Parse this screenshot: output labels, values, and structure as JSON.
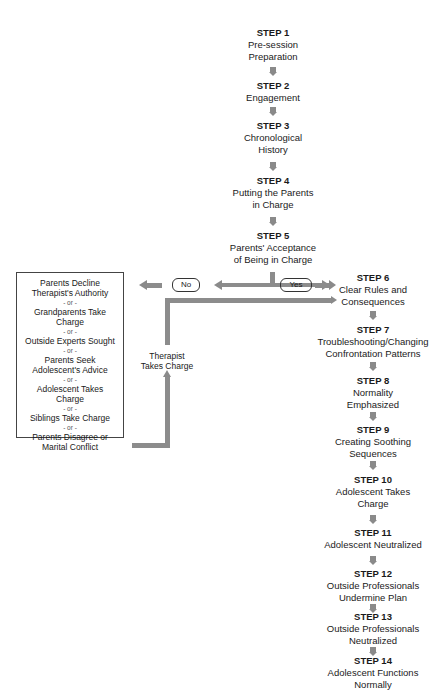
{
  "diagram": {
    "type": "flowchart",
    "main_steps": [
      {
        "step": "STEP 1",
        "text": "Pre-session\nPreparation"
      },
      {
        "step": "STEP 2",
        "text": "Engagement"
      },
      {
        "step": "STEP 3",
        "text": "Chronological\nHistory"
      },
      {
        "step": "STEP 4",
        "text": "Putting the Parents\nin Charge"
      },
      {
        "step": "STEP 5",
        "text": "Parents' Acceptance\nof Being in Charge"
      },
      {
        "step": "STEP 6",
        "text": "Clear Rules and\nConsequences"
      },
      {
        "step": "STEP 7",
        "text": "Troubleshooting/Changing\nConfrontation Patterns"
      },
      {
        "step": "STEP 8",
        "text": "Normality\nEmphasized"
      },
      {
        "step": "STEP 9",
        "text": "Creating Soothing\nSequences"
      },
      {
        "step": "STEP 10",
        "text": "Adolescent Takes\nCharge"
      },
      {
        "step": "STEP 11",
        "text": "Adolescent Neutralized"
      },
      {
        "step": "STEP 12",
        "text": "Outside Professionals\nUndermine Plan"
      },
      {
        "step": "STEP 13",
        "text": "Outside Professionals\nNeutralized"
      },
      {
        "step": "STEP 14",
        "text": "Adolescent Functions\nNormally"
      }
    ],
    "decision": {
      "no_label": "No",
      "yes_label": "Yes"
    },
    "alternatives": {
      "items": [
        "Parents Decline\nTherapist's Authority",
        "Grandparents Take\nCharge",
        "Outside Experts Sought",
        "Parents Seek\nAdolescent's Advice",
        "Adolescent Takes\nCharge",
        "Siblings Take Charge",
        "Parents Disagree or\nMarital Conflict"
      ],
      "separator": "- or -"
    },
    "loop_label": "Therapist\nTakes Charge",
    "colors": {
      "arrow": "#8a8a8a",
      "text": "#1a1a1a",
      "border": "#444444"
    }
  }
}
